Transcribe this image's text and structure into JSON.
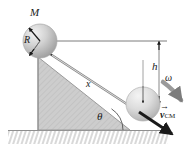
{
  "figure": {
    "labels": {
      "mass": "M",
      "radius": "R",
      "distance": "x",
      "height": "h",
      "angle": "θ",
      "angular_velocity": "ω",
      "velocity_symbol": "v",
      "velocity_arrow": "→",
      "velocity_subscript": "CM"
    },
    "colors": {
      "incline_fill": "#c9c9c9",
      "incline_stroke": "#8f8f8f",
      "sphere_light": "#f0f0f0",
      "sphere_mid": "#c4c4c4",
      "sphere_dark": "#9a9a9a",
      "line": "#6e6e6e",
      "arrow_dark": "#1a1a1a",
      "ground_hatch": "#b5b5b5",
      "omega_arrow": "#8a8a8a"
    },
    "geometry": {
      "upper_sphere_center": [
        40,
        41
      ],
      "upper_sphere_radius": 17,
      "lower_sphere_center": [
        143,
        104
      ],
      "lower_sphere_radius": 17,
      "incline_apex": [
        38,
        57
      ],
      "incline_base_left": [
        38,
        130
      ],
      "incline_base_right": [
        130,
        130
      ],
      "ground_y": 130,
      "horizontal_ref_line": [
        [
          40,
          41
        ],
        [
          166,
          41
        ]
      ],
      "height_arrow": [
        [
          159,
          41
        ],
        [
          159,
          104
        ]
      ],
      "incline_angle_deg": 38
    }
  }
}
